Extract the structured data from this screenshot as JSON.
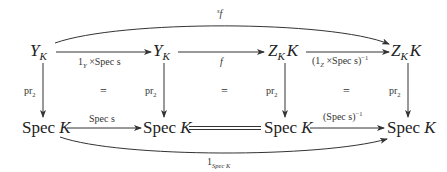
{
  "diagram": {
    "type": "commutative-diagram",
    "nodes": {
      "top": [
        {
          "base": "Y",
          "sub": "K",
          "extra": ""
        },
        {
          "base": "Y",
          "sub": "K",
          "extra": ""
        },
        {
          "base": "Z",
          "sub": "K",
          "extra": "K"
        },
        {
          "base": "Z",
          "sub": "K",
          "extra": "K"
        }
      ],
      "bottom": [
        {
          "op": "Spec",
          "arg": "K"
        },
        {
          "op": "Spec",
          "arg": "K"
        },
        {
          "op": "Spec",
          "arg": "K"
        },
        {
          "op": "Spec",
          "arg": "K"
        }
      ]
    },
    "arrows": {
      "top_curve": {
        "label_sup": "s",
        "label_main": "f"
      },
      "top_1": {
        "one": "1",
        "one_sub": "Y",
        "times": "×",
        "rest": "Spec s"
      },
      "top_2": {
        "label": "f"
      },
      "top_3": {
        "open": "(1",
        "one_sub": "Z",
        "times": "×",
        "rest": "Spec s)",
        "sup": "−1"
      },
      "vertical": [
        "pr",
        "pr",
        "pr",
        "pr"
      ],
      "vertical_sub": "2",
      "squares_eq": [
        "=",
        "=",
        "="
      ],
      "bottom_1": {
        "label": "Spec s"
      },
      "bottom_2": {
        "label": "equality"
      },
      "bottom_3": {
        "label": "(Spec s)",
        "sup": "−1"
      },
      "bottom_curve": {
        "one": "1",
        "sub": "Spec K"
      }
    }
  }
}
